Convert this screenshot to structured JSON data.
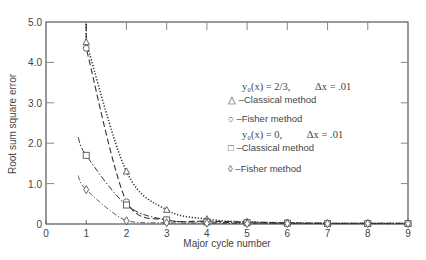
{
  "chart_data": {
    "type": "line",
    "title": "",
    "xlabel": "Major cycle number",
    "ylabel": "Root sum square error",
    "xlim": [
      0,
      9
    ],
    "ylim": [
      0,
      5.0
    ],
    "x_ticks": [
      "0",
      "1",
      "2",
      "3",
      "4",
      "5",
      "6",
      "7",
      "8",
      "9"
    ],
    "y_ticks": [
      "0",
      "1.0",
      "2.0",
      "3.0",
      "4.0",
      "5.0"
    ],
    "grid": false,
    "legend_position": "center-right",
    "legend_groups": [
      {
        "condition": "y₀(x) = 2/3,",
        "dx": "Δx = .01"
      },
      {
        "condition": "y₀(x) = 0,",
        "dx": "Δx = .01"
      }
    ],
    "series": [
      {
        "name": "Classical method (y0=2/3)",
        "marker": "triangle",
        "line": "dotted",
        "x": [
          1,
          2,
          3,
          4,
          5,
          6,
          7,
          8,
          9
        ],
        "values": [
          4.5,
          1.3,
          0.35,
          0.12,
          0.05,
          0.03,
          0.02,
          0.02,
          0.02
        ]
      },
      {
        "name": "Fisher method (y0=2/3)",
        "marker": "circle",
        "line": "dashed",
        "x": [
          1,
          2,
          3,
          4,
          5,
          6,
          7,
          8,
          9
        ],
        "values": [
          4.35,
          0.55,
          0.1,
          0.07,
          0.05,
          0.03,
          0.02,
          0.02,
          0.02
        ]
      },
      {
        "name": "Classical method (y0=0)",
        "marker": "square",
        "line": "dash-dot",
        "x": [
          0.8,
          1,
          2,
          3,
          4,
          5,
          6,
          7,
          8,
          9
        ],
        "values": [
          2.15,
          1.7,
          0.47,
          0.1,
          0.05,
          0.03,
          0.02,
          0.01,
          0.01,
          0.01
        ]
      },
      {
        "name": "Fisher method (y0=0)",
        "marker": "diamond",
        "line": "dash-dot-thin",
        "x": [
          0.8,
          1,
          2,
          3,
          4,
          5,
          6,
          7,
          8,
          9
        ],
        "values": [
          1.2,
          0.85,
          0.08,
          0.03,
          0.02,
          0.01,
          0.01,
          0.01,
          0.01,
          0.01
        ]
      }
    ]
  },
  "legend": {
    "group1_eq": "y₀(x) = 2/3,",
    "group1_dx": "Δx = .01",
    "item1_symbol": "△",
    "item1_label": "–Classical method",
    "item2_symbol": "○",
    "item2_label": "–Fisher method",
    "group2_eq": "y₀(x) = 0,",
    "group2_dx": "Δx = .01",
    "item3_symbol": "□",
    "item3_label": "–Classical method",
    "item4_symbol": "◊",
    "item4_label": "–Fisher method"
  }
}
